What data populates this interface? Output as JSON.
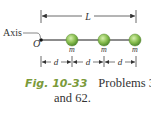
{
  "figure": {
    "labels": {
      "length": "L",
      "axis": "Axis",
      "origin": "O",
      "spacing": "d",
      "mass": "m"
    },
    "particles": [
      {
        "label": "m"
      },
      {
        "label": "m"
      },
      {
        "label": "m"
      }
    ],
    "colors": {
      "particle_fill": "#8cc152",
      "particle_stroke": "#4a7a2a",
      "rod": "#555555",
      "caption_accent": "#7a9a3a"
    }
  },
  "caption": {
    "fig_label": "Fig. 10-33",
    "text_line1": "Problems 36",
    "text_line2": "and 62."
  }
}
